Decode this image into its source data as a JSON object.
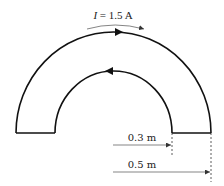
{
  "diagram": {
    "current_label": {
      "symbol": "I",
      "equals": " = 1.5 A"
    },
    "dimensions": [
      {
        "label": "0.3 m",
        "quantity": "inner radius"
      },
      {
        "label": "0.5 m",
        "quantity": "outer radius"
      }
    ],
    "colors": {
      "stroke": "#111111",
      "dim": "#333333",
      "background": "#ffffff"
    }
  }
}
